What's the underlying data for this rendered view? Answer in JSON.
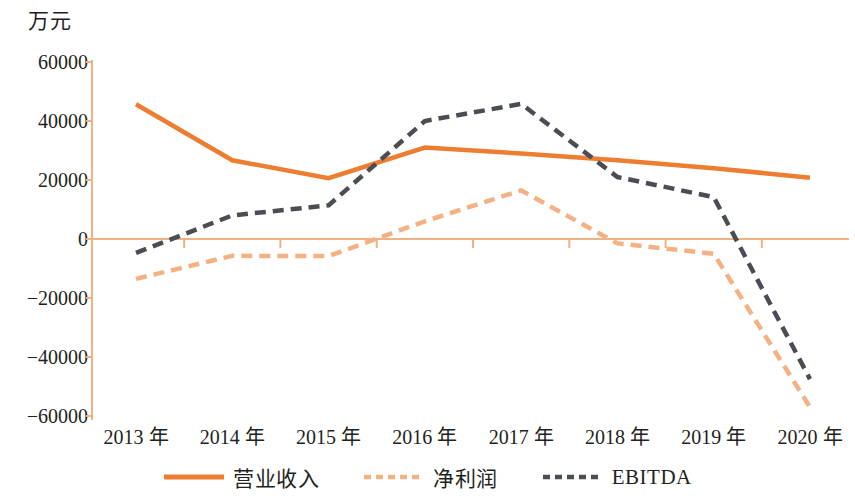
{
  "chart_data": {
    "type": "line",
    "title": "",
    "unit_label": "万元",
    "xlabel": "",
    "ylabel": "万元",
    "categories": [
      "2013 年",
      "2014 年",
      "2015 年",
      "2016 年",
      "2017 年",
      "2018 年",
      "2019 年",
      "2020 年"
    ],
    "x_values": [
      2013,
      2014,
      2015,
      2016,
      2017,
      2018,
      2019,
      2020
    ],
    "ylim": [
      -60000,
      60000
    ],
    "y_ticks": [
      60000,
      40000,
      20000,
      0,
      -20000,
      -40000,
      -60000
    ],
    "y_tick_labels": [
      "60000",
      "40000",
      "20000",
      "0",
      "−20000",
      "−40000",
      "−60000"
    ],
    "grid": false,
    "legend_position": "bottom",
    "series": [
      {
        "name": "营业收入",
        "style": "solid",
        "color": "#ED7D31",
        "values": [
          45700,
          26700,
          20600,
          31000,
          29000,
          26700,
          24000,
          20800
        ]
      },
      {
        "name": "净利润",
        "style": "dashed",
        "color": "#F4B183",
        "values": [
          -13500,
          -5700,
          -5800,
          6000,
          16500,
          -1500,
          -5000,
          -57000
        ]
      },
      {
        "name": "EBITDA",
        "style": "dashed",
        "color": "#4A4E54",
        "values": [
          -4700,
          8000,
          11400,
          40000,
          45800,
          21000,
          14200,
          -47500
        ]
      }
    ]
  },
  "legend": {
    "items": [
      {
        "label": "营业收入",
        "color": "#ED7D31",
        "style": "solid",
        "swatch_name": "legend-swatch-revenue"
      },
      {
        "label": "净利润",
        "color": "#F4B183",
        "style": "dashed",
        "swatch_name": "legend-swatch-net-profit"
      },
      {
        "label": "EBITDA",
        "color": "#4A4E54",
        "style": "dashed",
        "swatch_name": "legend-swatch-ebitda"
      }
    ]
  },
  "colors": {
    "axis": "#F0B183",
    "revenue": "#ED7D31",
    "net_profit": "#F4B183",
    "ebitda": "#4A4E54",
    "text": "#231f20",
    "background": "#ffffff"
  }
}
